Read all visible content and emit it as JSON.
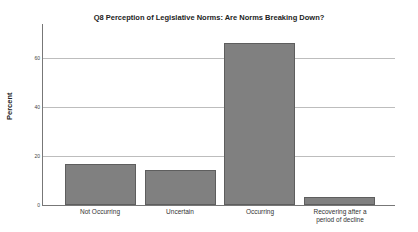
{
  "chart_data": {
    "type": "bar",
    "title": "Q8 Perception of Legislative Norms:  Are Norms Breaking Down?",
    "xlabel": "",
    "ylabel": "Percent",
    "categories": [
      "Not Occurring",
      "Uncertain",
      "Occurring",
      "Recovering after a period of decline"
    ],
    "values": [
      16.7,
      14.3,
      66.1,
      3.3
    ],
    "ylim": [
      0,
      74
    ],
    "yticks": [
      0,
      20,
      40,
      60
    ],
    "grid": true,
    "legend": null,
    "bar_color": "#808080"
  },
  "labels": {
    "title": "Q8 Perception of Legislative Norms:  Are Norms Breaking Down?",
    "ylabel": "Percent",
    "ytick0": "0",
    "ytick20": "20",
    "ytick40": "40",
    "ytick60": "60",
    "cat0": "Not Occurring",
    "cat1": "Uncertain",
    "cat2": "Occurring",
    "cat3_line1": "Recovering after a",
    "cat3_line2": "period of decline"
  }
}
